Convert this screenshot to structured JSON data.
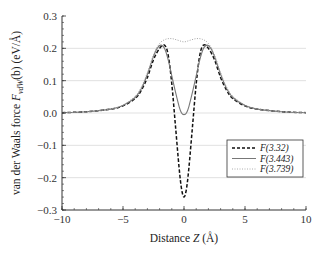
{
  "chart_data": {
    "type": "line",
    "title": "",
    "xlabel": "Distance Z (Å)",
    "ylabel": "van der Waals force F_vdW(b) (eV/Å)",
    "xlim": [
      -10,
      10
    ],
    "ylim": [
      -0.3,
      0.3
    ],
    "xticks": [
      -10,
      -5,
      0,
      5,
      10
    ],
    "xtick_labels": [
      "−10",
      "−5",
      "0",
      "5",
      "10"
    ],
    "yticks": [
      0.3,
      0.2,
      0.1,
      0.0,
      -0.1,
      -0.2,
      -0.3
    ],
    "ytick_labels": [
      "0.3",
      "0.2",
      "0.1",
      "0.0",
      "−0.1",
      "−0.2",
      "−0.3"
    ],
    "grid": {
      "horizontal": true,
      "vertical": false,
      "color": "#d9d9d9"
    },
    "legend": {
      "position": "lower right",
      "entries": [
        "F(3.32)",
        "F(3.443)",
        "F(3.739)"
      ]
    },
    "series": [
      {
        "name": "F(3.32)",
        "style": "dashed",
        "color": "#111111",
        "x": [
          -10,
          -8,
          -6,
          -5,
          -4,
          -3.5,
          -3,
          -2.5,
          -2,
          -1.6,
          -1.3,
          -1.0,
          -0.7,
          -0.4,
          -0.2,
          0,
          0.2,
          0.4,
          0.7,
          1.0,
          1.3,
          1.6,
          2,
          2.5,
          3,
          3.5,
          4,
          5,
          6,
          8,
          10
        ],
        "y": [
          0.001,
          0.004,
          0.012,
          0.022,
          0.045,
          0.07,
          0.11,
          0.165,
          0.2,
          0.21,
          0.18,
          0.09,
          -0.04,
          -0.17,
          -0.235,
          -0.26,
          -0.235,
          -0.17,
          -0.04,
          0.09,
          0.18,
          0.21,
          0.2,
          0.165,
          0.11,
          0.07,
          0.045,
          0.022,
          0.012,
          0.004,
          0.001
        ]
      },
      {
        "name": "F(3.443)",
        "style": "solid",
        "color": "#777777",
        "x": [
          -10,
          -8,
          -6,
          -5,
          -4,
          -3.5,
          -3,
          -2.5,
          -2.2,
          -1.9,
          -1.6,
          -1.3,
          -1.0,
          -0.7,
          -0.4,
          -0.2,
          0,
          0.2,
          0.4,
          0.7,
          1.0,
          1.3,
          1.6,
          1.9,
          2.2,
          2.5,
          3,
          3.5,
          4,
          5,
          6,
          8,
          10
        ],
        "y": [
          0.001,
          0.004,
          0.012,
          0.023,
          0.048,
          0.075,
          0.12,
          0.175,
          0.2,
          0.21,
          0.2,
          0.165,
          0.115,
          0.065,
          0.02,
          0.0,
          -0.005,
          0.0,
          0.02,
          0.065,
          0.115,
          0.165,
          0.2,
          0.21,
          0.2,
          0.175,
          0.12,
          0.075,
          0.048,
          0.023,
          0.012,
          0.004,
          0.001
        ]
      },
      {
        "name": "F(3.739)",
        "style": "dotted",
        "color": "#999999",
        "x": [
          -10,
          -8,
          -6,
          -5,
          -4,
          -3.5,
          -3,
          -2.5,
          -2,
          -1.5,
          -1.0,
          -0.5,
          0,
          0.5,
          1.0,
          1.5,
          2,
          2.5,
          3,
          3.5,
          4,
          5,
          6,
          8,
          10
        ],
        "y": [
          0.001,
          0.004,
          0.013,
          0.025,
          0.052,
          0.08,
          0.125,
          0.18,
          0.215,
          0.228,
          0.23,
          0.225,
          0.22,
          0.225,
          0.23,
          0.228,
          0.215,
          0.18,
          0.125,
          0.08,
          0.052,
          0.025,
          0.013,
          0.004,
          0.001
        ]
      }
    ]
  },
  "labels": {
    "ylabel_prefix": "van der Waals force ",
    "ylabel_F": "F",
    "ylabel_sub": "vdW",
    "ylabel_arg": "(b) (eV/Å)",
    "xlabel_prefix": "Distance ",
    "xlabel_Z": "Z",
    "xlabel_unit": " (Å)"
  }
}
